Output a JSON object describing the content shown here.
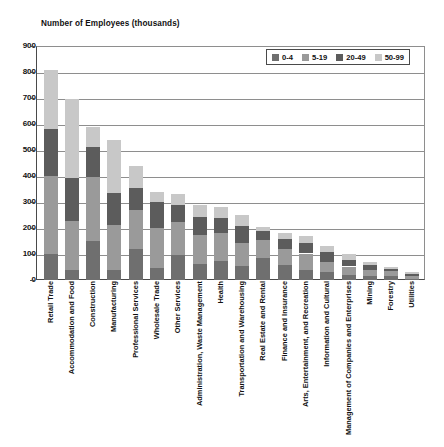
{
  "chart_data": {
    "type": "bar",
    "title": "Number of Employees (thousands)",
    "subtitle": "",
    "xlabel": "",
    "ylabel": "Number of Employees (thousands)",
    "ylim": [
      0,
      900
    ],
    "ytick_step": 100,
    "yticks": [
      "0",
      "100",
      "200",
      "300",
      "400",
      "500",
      "600",
      "700",
      "800",
      "900"
    ],
    "grid": true,
    "stacked": true,
    "legend_position": "top-right",
    "legend_title": "",
    "categories": [
      "Retail Trade",
      "Accommodation and Food",
      "Construction",
      "Manufacturing",
      "Professional Services",
      "Wholesale Trade",
      "Other Services",
      "Administration, Waste Management",
      "Health",
      "Transportation and Warehousing",
      "Real Estate and Rental",
      "Finance and Insurance",
      "Arts, Entertainment, and Recreation",
      "Information and Cultural",
      "Management of Companies and Enterprises",
      "Mining",
      "Forestry",
      "Utilities"
    ],
    "series": [
      {
        "name": "0-4",
        "color": "#6f6f6f",
        "values": [
          100,
          38,
          150,
          40,
          120,
          48,
          95,
          62,
          72,
          52,
          85,
          58,
          40,
          30,
          20,
          14,
          16,
          4
        ]
      },
      {
        "name": "5-19",
        "color": "#9a9a9a",
        "values": [
          300,
          190,
          245,
          170,
          150,
          152,
          130,
          110,
          108,
          92,
          70,
          62,
          62,
          40,
          32,
          24,
          18,
          10
        ]
      },
      {
        "name": "20-49",
        "color": "#5c5c5c",
        "values": [
          180,
          165,
          115,
          125,
          85,
          100,
          62,
          72,
          58,
          62,
          34,
          36,
          40,
          36,
          26,
          20,
          10,
          10
        ]
      },
      {
        "name": "50-99",
        "color": "#c8c8c8",
        "values": [
          228,
          302,
          80,
          205,
          85,
          40,
          43,
          46,
          42,
          44,
          16,
          24,
          28,
          24,
          22,
          12,
          6,
          6
        ]
      }
    ]
  }
}
